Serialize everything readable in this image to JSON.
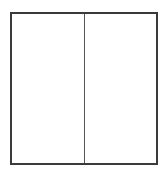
{
  "diagram": {
    "shape": "rectangle",
    "divisions": 2,
    "orientation": "vertical-split",
    "panels": [
      {
        "id": "left",
        "label": ""
      },
      {
        "id": "right",
        "label": ""
      }
    ],
    "colors": {
      "border": "#3a3a3a",
      "divider": "#555555",
      "fill": "#ffffff"
    }
  }
}
